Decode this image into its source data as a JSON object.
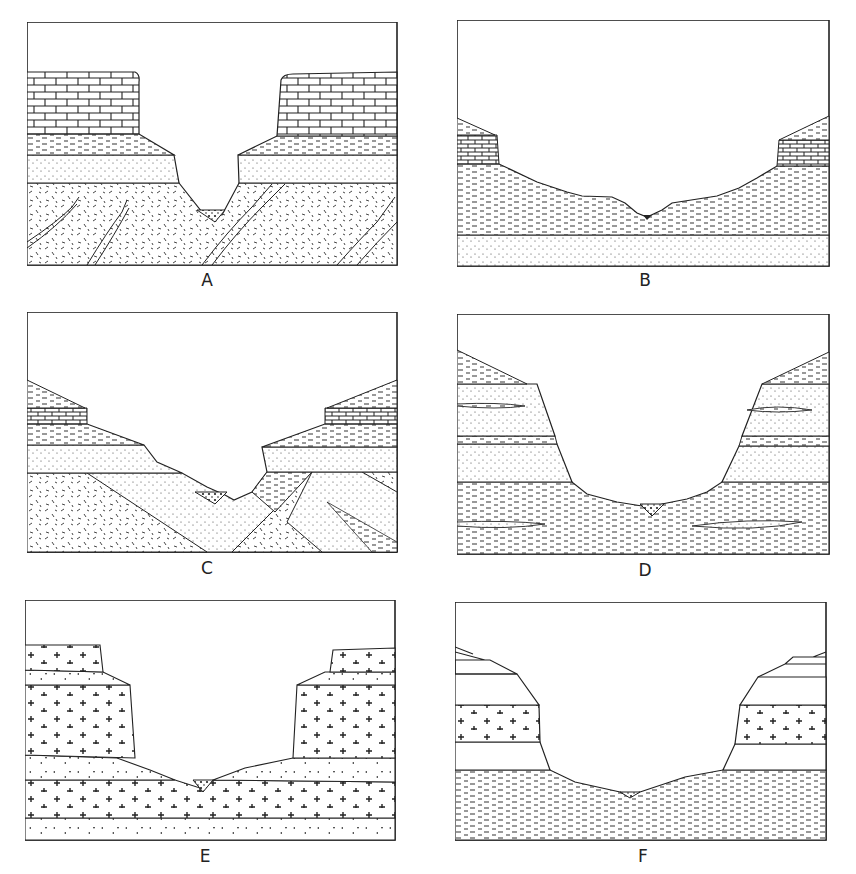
{
  "figure": {
    "ink_color": "#222222",
    "background_color": "#ffffff"
  },
  "panels": [
    {
      "id": "A",
      "label": "A",
      "layers": [
        "limestone (brick)",
        "shale (dashes)",
        "sandstone (dots)",
        "metamorphic basement with folded dikes"
      ],
      "valley": "narrow V-shaped gorge with flat-topped cliffs"
    },
    {
      "id": "B",
      "label": "B",
      "layers": [
        "shale cap",
        "thin limestone",
        "thick shale",
        "sandstone"
      ],
      "valley": "broad stepped open V valley"
    },
    {
      "id": "C",
      "label": "C",
      "layers": [
        "shale",
        "limestone",
        "shale",
        "sandstone",
        "tilted crystalline and sedimentary beds"
      ],
      "valley": "asymmetric V over tilted strata"
    },
    {
      "id": "D",
      "label": "D",
      "layers": [
        "shale",
        "sandstone with shale lenses",
        "shale band",
        "sandstone",
        "shale with sandstone lenses"
      ],
      "valley": "U-shaped valley with steep walls"
    },
    {
      "id": "E",
      "label": "E",
      "layers": [
        "granite",
        "volcanic breccia",
        "granite",
        "volcanic breccia",
        "granite",
        "volcanic breccia"
      ],
      "valley": "box canyon with stepped cliffs"
    },
    {
      "id": "F",
      "label": "F",
      "layers": [
        "blank strata",
        "granite band",
        "blank strata",
        "shale"
      ],
      "valley": "broad U-shaped valley"
    }
  ]
}
